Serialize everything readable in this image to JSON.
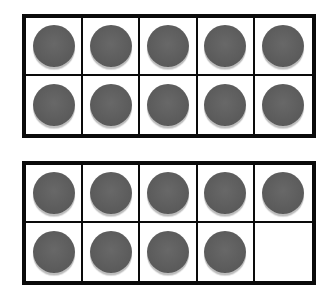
{
  "diagram": {
    "type": "ten-frames",
    "colors": {
      "border": "#0a0a0a",
      "counter": "#5c5c5c",
      "counter_rim": "#bdbdbd",
      "background": "#ffffff"
    },
    "frames": [
      {
        "name": "top",
        "rows": 2,
        "cols": 5,
        "filled_count": 10,
        "cells": [
          true,
          true,
          true,
          true,
          true,
          true,
          true,
          true,
          true,
          true
        ]
      },
      {
        "name": "bottom",
        "rows": 2,
        "cols": 5,
        "filled_count": 9,
        "cells": [
          true,
          true,
          true,
          true,
          true,
          true,
          true,
          true,
          true,
          false
        ]
      }
    ],
    "total_counters": 19
  }
}
